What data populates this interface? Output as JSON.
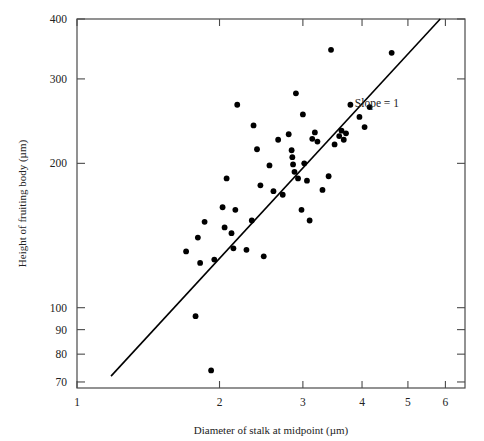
{
  "chart_data": {
    "type": "scatter",
    "title": "",
    "xlabel": "Diameter of stalk at midpoint (µm)",
    "ylabel": "Height of fruiting body (µm)",
    "xscale": "log",
    "yscale": "log",
    "xlim": [
      1,
      6.6
    ],
    "ylim": [
      68,
      400
    ],
    "xticks": [
      1,
      2,
      3,
      4,
      5,
      6
    ],
    "xtick_labels": [
      "1",
      "2",
      "3",
      "4",
      "5",
      "6"
    ],
    "yticks": [
      70,
      80,
      90,
      100,
      200,
      300,
      400
    ],
    "ytick_labels": [
      "70",
      "80",
      "90",
      "100",
      "200",
      "300",
      "400"
    ],
    "grid": false,
    "legend": false,
    "frame": "box",
    "marker": "filled-circle",
    "marker_color": "#000000",
    "marker_size_px": 5,
    "annotations": [
      {
        "text": "Slope = 1",
        "x": 4.3,
        "y": 262,
        "name": "slope-annotation"
      }
    ],
    "fit_line": {
      "label": "Slope = 1",
      "color": "#000000",
      "width_px": 1.6,
      "x_start": 1.18,
      "y_start": 72,
      "x_end": 5.85,
      "y_end": 400
    },
    "points": [
      {
        "x": 1.7,
        "y": 131
      },
      {
        "x": 1.78,
        "y": 96
      },
      {
        "x": 1.8,
        "y": 140
      },
      {
        "x": 1.82,
        "y": 124
      },
      {
        "x": 1.86,
        "y": 151
      },
      {
        "x": 1.92,
        "y": 74
      },
      {
        "x": 1.95,
        "y": 126
      },
      {
        "x": 2.03,
        "y": 162
      },
      {
        "x": 2.05,
        "y": 147
      },
      {
        "x": 2.07,
        "y": 186
      },
      {
        "x": 2.12,
        "y": 143
      },
      {
        "x": 2.14,
        "y": 133
      },
      {
        "x": 2.16,
        "y": 160
      },
      {
        "x": 2.18,
        "y": 265
      },
      {
        "x": 2.28,
        "y": 132
      },
      {
        "x": 2.34,
        "y": 152
      },
      {
        "x": 2.36,
        "y": 240
      },
      {
        "x": 2.4,
        "y": 214
      },
      {
        "x": 2.44,
        "y": 180
      },
      {
        "x": 2.48,
        "y": 128
      },
      {
        "x": 2.55,
        "y": 198
      },
      {
        "x": 2.6,
        "y": 175
      },
      {
        "x": 2.66,
        "y": 224
      },
      {
        "x": 2.72,
        "y": 172
      },
      {
        "x": 2.8,
        "y": 230
      },
      {
        "x": 2.84,
        "y": 213
      },
      {
        "x": 2.85,
        "y": 206
      },
      {
        "x": 2.86,
        "y": 199
      },
      {
        "x": 2.88,
        "y": 192
      },
      {
        "x": 2.9,
        "y": 280
      },
      {
        "x": 2.93,
        "y": 186
      },
      {
        "x": 2.98,
        "y": 160
      },
      {
        "x": 3.0,
        "y": 253
      },
      {
        "x": 3.02,
        "y": 200
      },
      {
        "x": 3.06,
        "y": 184
      },
      {
        "x": 3.1,
        "y": 152
      },
      {
        "x": 3.14,
        "y": 225
      },
      {
        "x": 3.18,
        "y": 232
      },
      {
        "x": 3.22,
        "y": 222
      },
      {
        "x": 3.3,
        "y": 176
      },
      {
        "x": 3.4,
        "y": 188
      },
      {
        "x": 3.44,
        "y": 345
      },
      {
        "x": 3.5,
        "y": 219
      },
      {
        "x": 3.58,
        "y": 228
      },
      {
        "x": 3.62,
        "y": 234
      },
      {
        "x": 3.66,
        "y": 224
      },
      {
        "x": 3.7,
        "y": 231
      },
      {
        "x": 3.78,
        "y": 265
      },
      {
        "x": 3.95,
        "y": 250
      },
      {
        "x": 4.05,
        "y": 238
      },
      {
        "x": 4.15,
        "y": 262
      },
      {
        "x": 4.62,
        "y": 340
      }
    ]
  }
}
